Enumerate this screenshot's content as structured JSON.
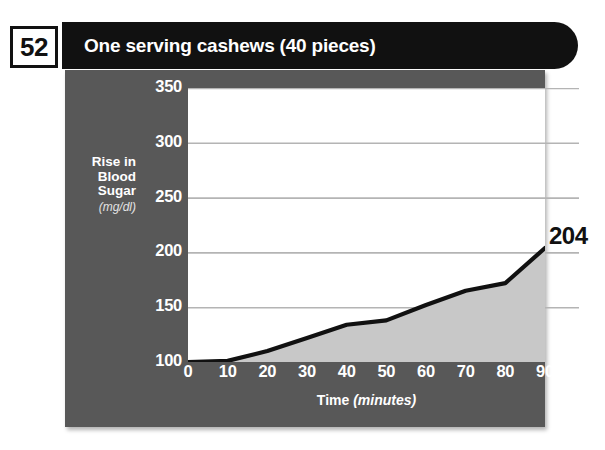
{
  "badge": {
    "number": "52"
  },
  "header": {
    "title": "One serving cashews (40 pieces)"
  },
  "axes": {
    "y_title_line1": "Rise in",
    "y_title_line2": "Blood",
    "y_title_line3": "Sugar",
    "y_units": "(mg/dl)",
    "x_title": "Time",
    "x_units": "(minutes)"
  },
  "annotations": {
    "end_value": "204"
  },
  "colors": {
    "panel": "#585858",
    "title_bar": "#111111",
    "plot_background": "#ffffff",
    "area_fill": "#c8c8c8",
    "line": "#111111",
    "gridline": "#b4b4b4",
    "tick_text": "#ffffff"
  },
  "chart_data": {
    "type": "line",
    "title": "One serving cashews (40 pieces)",
    "xlabel": "Time (minutes)",
    "ylabel": "Rise in Blood Sugar (mg/dl)",
    "xlim": [
      0,
      90
    ],
    "ylim": [
      100,
      350
    ],
    "xticks": [
      0,
      10,
      20,
      30,
      40,
      50,
      60,
      70,
      80,
      90
    ],
    "yticks": [
      100,
      150,
      200,
      250,
      300,
      350
    ],
    "grid": true,
    "legend": null,
    "area_filled": true,
    "x": [
      0,
      10,
      20,
      30,
      40,
      50,
      60,
      70,
      80,
      90
    ],
    "values": [
      100,
      101,
      110,
      122,
      134,
      138,
      152,
      165,
      172,
      204
    ],
    "series": [
      {
        "name": "Rise in Blood Sugar",
        "values": [
          100,
          101,
          110,
          122,
          134,
          138,
          152,
          165,
          172,
          204
        ]
      }
    ],
    "data_labels": [
      {
        "x": 90,
        "y": 204,
        "text": "204"
      }
    ]
  }
}
